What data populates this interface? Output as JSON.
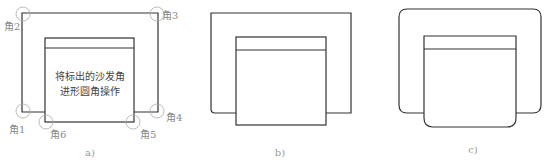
{
  "figures": [
    {
      "caption": "a)",
      "note_line1": "将标出的沙发角",
      "note_line2": "进形圆角操作",
      "corner_labels": [
        "角1",
        "角2",
        "角3",
        "角4",
        "角5",
        "角6"
      ]
    },
    {
      "caption": "b)"
    },
    {
      "caption": "c)"
    }
  ],
  "colors": {
    "stroke": "#333333",
    "marker": "#aaaaaa",
    "label": "#888888"
  }
}
